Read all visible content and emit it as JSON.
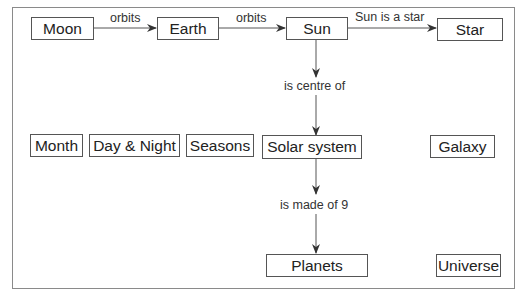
{
  "diagram": {
    "type": "concept-map",
    "nodes": {
      "moon": "Moon",
      "earth": "Earth",
      "sun": "Sun",
      "star": "Star",
      "month": "Month",
      "day_night": "Day & Night",
      "seasons": "Seasons",
      "solar_system": "Solar system",
      "galaxy": "Galaxy",
      "planets": "Planets",
      "universe": "Universe"
    },
    "edges": {
      "moon_earth": "orbits",
      "earth_sun": "orbits",
      "sun_star": "Sun is a star",
      "sun_solar": "is centre of",
      "solar_planets": "is made of 9"
    },
    "colors": {
      "line": "#555555",
      "frame": "#8a8a8a",
      "text": "#222222"
    }
  }
}
